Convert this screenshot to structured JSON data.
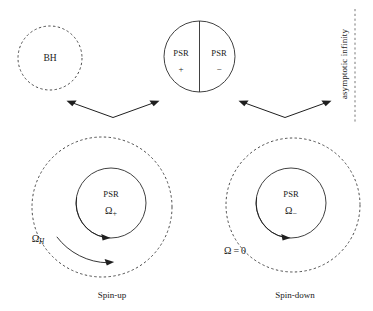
{
  "figure": {
    "background_color": "#ffffff",
    "ink_color": "#1a1a1a"
  },
  "top_row": {
    "black_hole": {
      "label": "BH",
      "style": "dashed-circle"
    },
    "pulsar_pair": {
      "left_label": "PSR",
      "left_sign": "+",
      "right_label": "PSR",
      "right_sign": "−",
      "style": "solid-circle-split"
    },
    "asymptotic_boundary": {
      "label": "asymptotic infinity",
      "orientation": "vertical-bottom-up",
      "line_style": "dashed"
    }
  },
  "connectors": [
    {
      "name": "left-v-arrow",
      "type": "double-headed-v"
    },
    {
      "name": "right-v-arrow",
      "type": "double-headed-v"
    }
  ],
  "bottom_row": {
    "spin_up": {
      "caption": "Spin-up",
      "outer_label": "Ω",
      "outer_label_sub": "H",
      "inner_title": "PSR",
      "inner_omega": "Ω",
      "inner_omega_sub": "+",
      "outer_style": "dashed-circle",
      "inner_style": "solid-circle",
      "rotation_arrows": 2,
      "rotation_direction": "clockwise"
    },
    "spin_down": {
      "caption": "Spin-down",
      "outer_label": "Ω = 0",
      "inner_title": "PSR",
      "inner_omega": "Ω",
      "inner_omega_sub": "−",
      "outer_style": "dashed-circle",
      "inner_style": "solid-circle",
      "rotation_arrows": 1,
      "rotation_direction": "clockwise"
    }
  },
  "colors": {
    "solid_stroke": "#2b2b2b",
    "dashed_stroke": "#3a3a3a",
    "arrow": "#1f1f1f",
    "boundary_dotted": "#6a6a6a"
  }
}
